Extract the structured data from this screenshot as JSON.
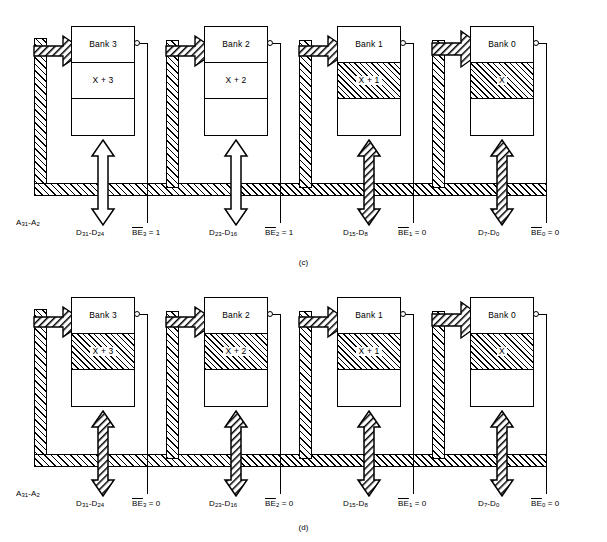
{
  "figure": {
    "panels": [
      {
        "caption": "(c)",
        "banks": [
          {
            "title": "Bank 3",
            "mid_value": "X + 3",
            "mid_hatched": false
          },
          {
            "title": "Bank 2",
            "mid_value": "X + 2",
            "mid_hatched": false
          },
          {
            "title": "Bank 1",
            "mid_value": "X + 1",
            "mid_hatched": true
          },
          {
            "title": "Bank 0",
            "mid_value": "X",
            "mid_hatched": true
          }
        ],
        "address_label": "A31-A2",
        "data_labels": [
          "D31-D24",
          "D23-D16",
          "D15-D8",
          "D7-D0"
        ],
        "be_labels": [
          "BE3 = 1",
          "BE2 = 1",
          "BE1 = 0",
          "BE0 = 0"
        ]
      },
      {
        "caption": "(d)",
        "banks": [
          {
            "title": "Bank 3",
            "mid_value": "X + 3",
            "mid_hatched": true
          },
          {
            "title": "Bank 2",
            "mid_value": "X + 2",
            "mid_hatched": true
          },
          {
            "title": "Bank 1",
            "mid_value": "X + 1",
            "mid_hatched": true
          },
          {
            "title": "Bank 0",
            "mid_value": "X",
            "mid_hatched": true
          }
        ],
        "address_label": "A31-A2",
        "data_labels": [
          "D31-D24",
          "D23-D16",
          "D15-D8",
          "D7-D0"
        ],
        "be_labels": [
          "BE3 = 0",
          "BE2 = 0",
          "BE1 = 0",
          "BE0 = 0"
        ]
      }
    ],
    "colors": {
      "line": "#000000",
      "background": "#ffffff"
    }
  }
}
